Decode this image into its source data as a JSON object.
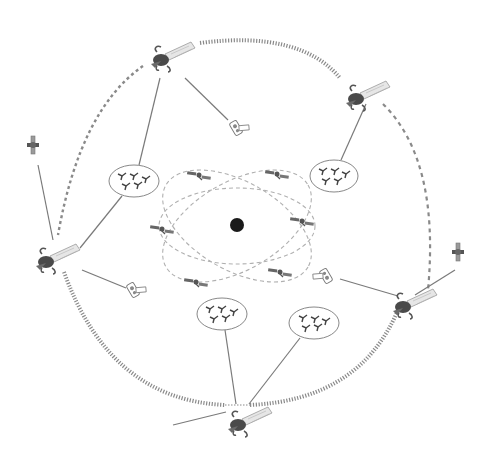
{
  "diagram": {
    "type": "satellite-network",
    "colors": {
      "background": "#ffffff",
      "isl_link": "#8a8a8a",
      "line": "#7a7a7a",
      "inner_orbit": "#b0b0b0",
      "earth": "#1a1a1a",
      "satellite_body": "#555555",
      "solar_panel": "#cfcfcf"
    },
    "earth": {
      "label": "",
      "x": 237,
      "y": 225,
      "r": 7
    },
    "geo_satellites": [
      {
        "id": "geo-top",
        "x": 165,
        "y": 56
      },
      {
        "id": "geo-upper-right",
        "x": 358,
        "y": 97
      },
      {
        "id": "geo-left",
        "x": 48,
        "y": 258
      },
      {
        "id": "geo-right",
        "x": 405,
        "y": 303
      },
      {
        "id": "geo-bottom",
        "x": 238,
        "y": 423
      }
    ],
    "small_satellites": [
      {
        "id": "sat-a",
        "x": 238,
        "y": 128
      },
      {
        "id": "sat-b",
        "x": 33,
        "y": 145
      },
      {
        "id": "sat-c",
        "x": 132,
        "y": 290
      },
      {
        "id": "sat-d",
        "x": 326,
        "y": 276
      },
      {
        "id": "sat-e",
        "x": 458,
        "y": 252
      }
    ],
    "user_clusters": [
      {
        "id": "cluster-1",
        "x": 134,
        "y": 181,
        "rx": 25,
        "ry": 16,
        "terminals": 5
      },
      {
        "id": "cluster-2",
        "x": 334,
        "y": 176,
        "rx": 24,
        "ry": 16,
        "terminals": 5
      },
      {
        "id": "cluster-3",
        "x": 222,
        "y": 314,
        "rx": 25,
        "ry": 16,
        "terminals": 5
      },
      {
        "id": "cluster-4",
        "x": 314,
        "y": 323,
        "rx": 25,
        "ry": 16,
        "terminals": 5
      }
    ],
    "leo_satellites": [
      {
        "id": "leo-1",
        "x": 199,
        "y": 175
      },
      {
        "id": "leo-2",
        "x": 277,
        "y": 174
      },
      {
        "id": "leo-3",
        "x": 162,
        "y": 229
      },
      {
        "id": "leo-4",
        "x": 302,
        "y": 221
      },
      {
        "id": "leo-5",
        "x": 196,
        "y": 282
      },
      {
        "id": "leo-6",
        "x": 280,
        "y": 272
      }
    ],
    "labels": []
  }
}
